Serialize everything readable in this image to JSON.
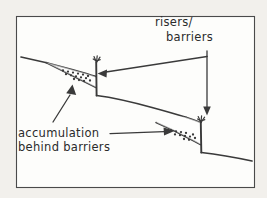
{
  "figure": {
    "kind": "hand-drawn-sketch",
    "background_color": "#f2f0ec",
    "paper_color": "#fdfdfb",
    "ink_color": "#3a3a3a"
  },
  "labels": {
    "risers": {
      "line1": "risers/",
      "line2": "barriers"
    },
    "accumulation": {
      "line1": "accumulation",
      "line2": "behind barriers"
    }
  },
  "annotations": {
    "riser_leader_targets": 2,
    "accumulation_leader_targets": 2
  },
  "features": {
    "upper_slope_label": "upper hillslope surface",
    "terrace_label": "mid terrace tread",
    "lower_slope_label": "lower hillslope surface",
    "riser_one_label": "riser one",
    "riser_two_label": "riser two",
    "wedge_one_label": "sediment wedge one",
    "wedge_two_label": "sediment wedge two",
    "vegetation_label": "vegetation tuft"
  },
  "stipple": {
    "wedge_one_dots": [
      [
        63,
        70.5
      ],
      [
        68,
        71.6
      ],
      [
        73,
        72.6
      ],
      [
        78,
        73.6
      ],
      [
        83,
        74.6
      ],
      [
        66,
        74.2
      ],
      [
        71,
        75.3
      ],
      [
        76,
        76.3
      ],
      [
        81,
        77.3
      ],
      [
        86,
        78.2
      ],
      [
        74,
        79.0
      ],
      [
        79,
        80.0
      ],
      [
        84,
        81.0
      ],
      [
        88,
        76.0
      ],
      [
        90,
        80.5
      ]
    ],
    "wedge_two_dots": [
      [
        171,
        130.5
      ],
      [
        176,
        131.3
      ],
      [
        181,
        132.1
      ],
      [
        186,
        132.9
      ],
      [
        175,
        134.4
      ],
      [
        180,
        135.2
      ],
      [
        185,
        136.0
      ],
      [
        190,
        136.6
      ],
      [
        184,
        139.0
      ],
      [
        189,
        139.8
      ],
      [
        193,
        134.5
      ],
      [
        195,
        138.0
      ]
    ]
  }
}
